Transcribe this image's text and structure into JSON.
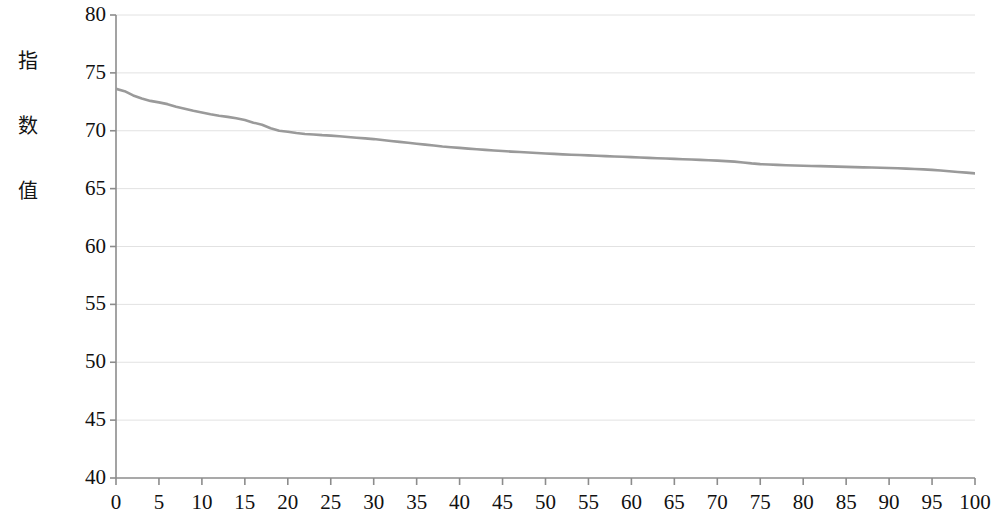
{
  "chart_data": {
    "type": "line",
    "title": "",
    "subtitle": "",
    "xlabel": "",
    "ylabel": "指数值",
    "ylabel_chars": [
      "指",
      "数",
      "值"
    ],
    "xlim": [
      0,
      100
    ],
    "ylim": [
      40,
      80
    ],
    "x_ticks": [
      0,
      5,
      10,
      15,
      20,
      25,
      30,
      35,
      40,
      45,
      50,
      55,
      60,
      65,
      70,
      75,
      80,
      85,
      90,
      95,
      100
    ],
    "y_ticks": [
      40,
      45,
      50,
      55,
      60,
      65,
      70,
      75,
      80
    ],
    "x_tick_labels": [
      "0",
      "5",
      "10",
      "15",
      "20",
      "25",
      "30",
      "35",
      "40",
      "45",
      "50",
      "55",
      "60",
      "65",
      "70",
      "75",
      "80",
      "85",
      "90",
      "95",
      "100"
    ],
    "y_tick_labels": [
      "40",
      "45",
      "50",
      "55",
      "60",
      "65",
      "70",
      "75",
      "80"
    ],
    "grid": {
      "horizontal": true,
      "vertical": false
    },
    "legend": {
      "visible": false,
      "position": "none"
    },
    "line_color": "#9a9a9a",
    "grid_color": "#e2e2e2",
    "axis_color": "#8c8c8c",
    "series": [
      {
        "name": "指数值",
        "color": "#9a9a9a",
        "x": [
          0,
          1,
          2,
          3,
          4,
          5,
          6,
          7,
          8,
          9,
          10,
          11,
          12,
          13,
          14,
          15,
          16,
          17,
          18,
          19,
          20,
          21,
          22,
          23,
          24,
          25,
          26,
          27,
          28,
          29,
          30,
          31,
          32,
          33,
          34,
          35,
          36,
          37,
          38,
          39,
          40,
          41,
          42,
          43,
          44,
          45,
          46,
          47,
          48,
          49,
          50,
          51,
          52,
          53,
          54,
          55,
          56,
          57,
          58,
          59,
          60,
          61,
          62,
          63,
          64,
          65,
          66,
          67,
          68,
          69,
          70,
          71,
          72,
          73,
          74,
          75,
          76,
          77,
          78,
          79,
          80,
          81,
          82,
          83,
          84,
          85,
          86,
          87,
          88,
          89,
          90,
          91,
          92,
          93,
          94,
          95,
          96,
          97,
          98,
          99,
          100
        ],
        "values": [
          73.62,
          73.42,
          73.05,
          72.78,
          72.58,
          72.45,
          72.3,
          72.08,
          71.9,
          71.72,
          71.58,
          71.42,
          71.3,
          71.2,
          71.08,
          70.92,
          70.7,
          70.52,
          70.22,
          70.0,
          69.92,
          69.8,
          69.72,
          69.68,
          69.62,
          69.58,
          69.52,
          69.46,
          69.4,
          69.34,
          69.28,
          69.2,
          69.12,
          69.04,
          68.96,
          68.88,
          68.8,
          68.72,
          68.64,
          68.58,
          68.52,
          68.46,
          68.4,
          68.35,
          68.3,
          68.25,
          68.2,
          68.16,
          68.12,
          68.08,
          68.04,
          68.0,
          67.96,
          67.93,
          67.9,
          67.87,
          67.84,
          67.81,
          67.78,
          67.75,
          67.72,
          67.69,
          67.66,
          67.63,
          67.6,
          67.57,
          67.54,
          67.51,
          67.48,
          67.45,
          67.42,
          67.38,
          67.33,
          67.26,
          67.18,
          67.12,
          67.08,
          67.05,
          67.02,
          67.0,
          66.98,
          66.96,
          66.94,
          66.92,
          66.9,
          66.88,
          66.86,
          66.84,
          66.82,
          66.8,
          66.78,
          66.76,
          66.73,
          66.7,
          66.66,
          66.62,
          66.56,
          66.5,
          66.44,
          66.38,
          66.32
        ]
      }
    ]
  }
}
